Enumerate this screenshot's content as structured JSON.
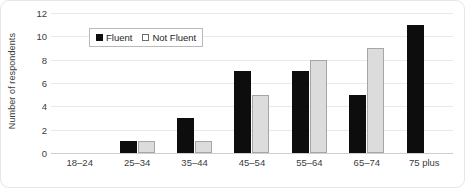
{
  "chart_data": {
    "type": "bar",
    "title": "",
    "subtitle": "",
    "xlabel": "",
    "ylabel": "Number of respondents",
    "categories": [
      "18–24",
      "25–34",
      "35–44",
      "45–54",
      "55–64",
      "65–74",
      "75 plus"
    ],
    "series": [
      {
        "name": "Fluent",
        "values": [
          0,
          1,
          3,
          7,
          7,
          5,
          11
        ],
        "color": "#0d0d0d"
      },
      {
        "name": "Not Fluent",
        "values": [
          0,
          1,
          1,
          5,
          8,
          9,
          0
        ],
        "color": "#dcdcdc"
      }
    ],
    "ylim": [
      0,
      12
    ],
    "yticks": [
      0,
      2,
      4,
      6,
      8,
      10,
      12
    ],
    "ytick_labels": [
      "0",
      "2",
      "4",
      "6",
      "8",
      "10",
      "12"
    ],
    "grid": "horizontal",
    "legend_position": "upper-left-inside",
    "annotations": []
  },
  "legend": {
    "entries": [
      {
        "label": "Fluent",
        "swatch": "filled-black-square"
      },
      {
        "label": "Not Fluent",
        "swatch": "open-square"
      }
    ]
  },
  "colors": {
    "fluent": "#0d0d0d",
    "not_fluent_fill": "#dcdcdc",
    "not_fluent_border": "#a6a6a6",
    "gridline": "#e9e9e9",
    "axis": "#cfcfcf",
    "text": "#3c3c3c",
    "card_border": "#e6e6e6",
    "background": "#ffffff"
  }
}
